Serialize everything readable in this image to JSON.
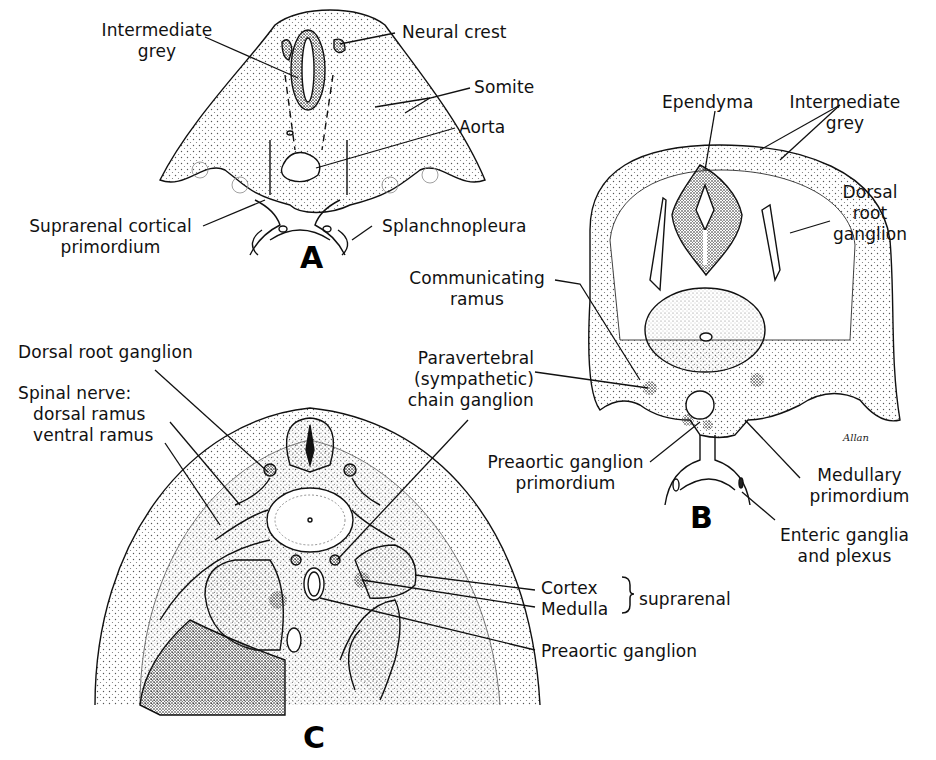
{
  "figure": {
    "panels": [
      {
        "id": "A",
        "label": "A",
        "annotations": [
          {
            "text_1": "Intermediate",
            "text_2": "grey"
          },
          {
            "text": "Neural crest"
          },
          {
            "text": "Somite"
          },
          {
            "text": "Aorta"
          },
          {
            "text_1": "Suprarenal cortical",
            "text_2": "primordium"
          },
          {
            "text": "Splanchnopleura"
          }
        ]
      },
      {
        "id": "B",
        "label": "B",
        "annotations": [
          {
            "text": "Ependyma"
          },
          {
            "text_1": "Intermediate",
            "text_2": "grey"
          },
          {
            "text_1": "Dorsal",
            "text_2": "root",
            "text_3": "ganglion"
          },
          {
            "text_1": "Communicating",
            "text_2": "ramus"
          },
          {
            "text_1": "Paravertebral",
            "text_2": "(sympathetic)",
            "text_3": "chain ganglion"
          },
          {
            "text_1": "Preaortic ganglion",
            "text_2": "primordium"
          },
          {
            "text_1": "Medullary",
            "text_2": "primordium"
          },
          {
            "text_1": "Enteric ganglia",
            "text_2": "and plexus"
          }
        ],
        "signature": "Allan"
      },
      {
        "id": "C",
        "label": "C",
        "annotations": [
          {
            "text": "Dorsal root ganglion"
          },
          {
            "text_1": "Spinal nerve:",
            "text_2": "dorsal ramus",
            "text_3": "ventral ramus"
          },
          {
            "text": "Cortex"
          },
          {
            "text": "Medulla"
          },
          {
            "text": "suprarenal"
          },
          {
            "text": "Preaortic ganglion"
          }
        ]
      }
    ],
    "colors": {
      "line": "#111111",
      "stipple": "#555555",
      "dense": "#1a1a1a",
      "background": "#ffffff"
    }
  }
}
